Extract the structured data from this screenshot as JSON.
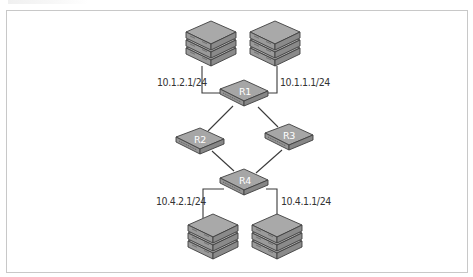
{
  "diagram": {
    "type": "network-topology",
    "colors": {
      "device_top": "#a7a7a7",
      "device_side": "#8c8c8c",
      "device_outline": "#3f3f3f",
      "link": "#3a3a3a",
      "label_text": "#333333",
      "router_label_text": "#ffffff",
      "frame_border": "#c8c8c8"
    },
    "routers": [
      {
        "id": "R1",
        "label": "R1"
      },
      {
        "id": "R2",
        "label": "R2"
      },
      {
        "id": "R3",
        "label": "R3"
      },
      {
        "id": "R4",
        "label": "R4"
      }
    ],
    "server_stacks": [
      {
        "id": "servers-top-left",
        "attached_to": "R1",
        "interface": "10.1.2.1/24"
      },
      {
        "id": "servers-top-right",
        "attached_to": "R1",
        "interface": "10.1.1.1/24"
      },
      {
        "id": "servers-bottom-left",
        "attached_to": "R4",
        "interface": "10.4.2.1/24"
      },
      {
        "id": "servers-bottom-right",
        "attached_to": "R4",
        "interface": "10.4.1.1/24"
      }
    ],
    "links": [
      [
        "servers-top-left",
        "R1"
      ],
      [
        "servers-top-right",
        "R1"
      ],
      [
        "R1",
        "R2"
      ],
      [
        "R1",
        "R3"
      ],
      [
        "R2",
        "R4"
      ],
      [
        "R3",
        "R4"
      ],
      [
        "R4",
        "servers-bottom-left"
      ],
      [
        "R4",
        "servers-bottom-right"
      ]
    ],
    "labels": {
      "r1_left_interface": "10.1.2.1/24",
      "r1_right_interface": "10.1.1.1/24",
      "r4_left_interface": "10.4.2.1/24",
      "r4_right_interface": "10.4.1.1/24"
    }
  }
}
